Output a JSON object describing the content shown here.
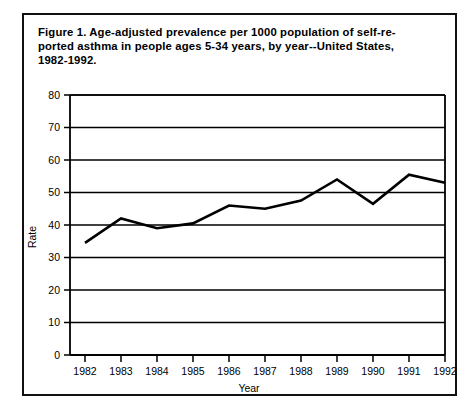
{
  "figure": {
    "caption": "Figure 1.  Age-adjusted prevalence per 1000 population of self-re-\nported asthma in people ages 5-34 years, by year--United States,\n1982-1992."
  },
  "chart_data": {
    "type": "line",
    "title": "",
    "xlabel": "Year",
    "ylabel": "Rate",
    "categories": [
      "1982",
      "1983",
      "1984",
      "1985",
      "1986",
      "1987",
      "1988",
      "1989",
      "1990",
      "1991",
      "1992"
    ],
    "x": [
      1982,
      1983,
      1984,
      1985,
      1986,
      1987,
      1988,
      1989,
      1990,
      1991,
      1992
    ],
    "values": [
      34.5,
      42.0,
      39.0,
      40.5,
      46.0,
      45.0,
      47.5,
      54.0,
      46.5,
      55.5,
      53.0
    ],
    "series": [
      {
        "name": "Age-adjusted prevalence per 1000",
        "values": [
          34.5,
          42.0,
          39.0,
          40.5,
          46.0,
          45.0,
          47.5,
          54.0,
          46.5,
          55.5,
          53.0
        ]
      }
    ],
    "ylim": [
      0,
      80
    ],
    "yticks": [
      0,
      10,
      20,
      30,
      40,
      50,
      60,
      70,
      80
    ],
    "ytick_labels": [
      "0",
      "10",
      "20",
      "30",
      "40",
      "50",
      "60",
      "70",
      "80"
    ],
    "xtick_labels": [
      "1982",
      "1983",
      "1984",
      "1985",
      "1986",
      "1987",
      "1988",
      "1989",
      "1990",
      "1991",
      "1992"
    ],
    "grid": "horizontal",
    "legend": "none",
    "line_color": "#000000"
  }
}
